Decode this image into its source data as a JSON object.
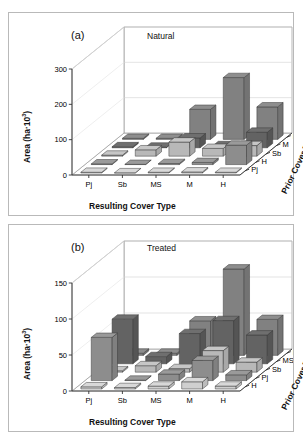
{
  "figure": {
    "background": "#ffffff",
    "border_color": "#b9b9b9"
  },
  "panels": [
    {
      "id": "a",
      "letter": "(a)",
      "subtitle": "Natural",
      "ylabel_prefix": "Area (ha·10",
      "ylabel_sup": "3",
      "ylabel_suffix": ")",
      "xlabel": "Resulting Cover Type",
      "zlabel": "Prior Cover Type",
      "yticks": [
        "0",
        "100",
        "200",
        "300"
      ],
      "xticks": [
        "Pj",
        "Sb",
        "MS",
        "M",
        "H"
      ],
      "zticks_front_to_back": [
        "Pj",
        "H",
        "Sb",
        "M",
        "MS"
      ]
    },
    {
      "id": "b",
      "letter": "(b)",
      "subtitle": "Treated",
      "ylabel_prefix": "Area (ha·10",
      "ylabel_sup": "3",
      "ylabel_suffix": ")",
      "xlabel": "Resulting Cover Type",
      "zlabel": "Prior Cover Type",
      "yticks": [
        "0",
        "50",
        "100",
        "150"
      ],
      "xticks": [
        "Pj",
        "Sb",
        "MS",
        "M",
        "H"
      ],
      "zticks_front_to_back": [
        "H",
        "Pj",
        "Sb",
        "MS",
        "M"
      ]
    }
  ],
  "row_colors": {
    "top": [
      "#d8d8d8",
      "#9a9a9a",
      "#c6c6c6",
      "#6f6f6f",
      "#8e8e8e"
    ],
    "side": [
      "#bcbcbc",
      "#808080",
      "#a8a8a8",
      "#555555",
      "#737373"
    ],
    "front": [
      "#cfcfcf",
      "#8d8d8d",
      "#b8b8b8",
      "#636363",
      "#818181"
    ]
  },
  "chart_data": [
    {
      "type": "bar",
      "title": "Natural",
      "subplot": "(a)",
      "xlabel": "Resulting Cover Type",
      "ylabel": "Area (ha·10^3)",
      "zlabel": "Prior Cover Type",
      "categories": [
        "Pj",
        "Sb",
        "MS",
        "M",
        "H"
      ],
      "ylim": [
        0,
        300
      ],
      "yticks": [
        0,
        100,
        200,
        300
      ],
      "grid": true,
      "legend": "none",
      "series": [
        {
          "name": "Pj",
          "row_index": 0,
          "values": [
            2,
            0,
            2,
            3,
            2
          ]
        },
        {
          "name": "H",
          "row_index": 1,
          "values": [
            2,
            0,
            3,
            6,
            55
          ]
        },
        {
          "name": "Sb",
          "row_index": 2,
          "values": [
            3,
            18,
            40,
            22,
            30
          ]
        },
        {
          "name": "M",
          "row_index": 3,
          "values": [
            3,
            2,
            28,
            6,
            44
          ]
        },
        {
          "name": "MS",
          "row_index": 4,
          "values": [
            3,
            3,
            85,
            175,
            92
          ]
        }
      ]
    },
    {
      "type": "bar",
      "title": "Treated",
      "subplot": "(b)",
      "xlabel": "Resulting Cover Type",
      "ylabel": "Area (ha·10^3)",
      "zlabel": "Prior Cover Type",
      "categories": [
        "Pj",
        "Sb",
        "MS",
        "M",
        "H"
      ],
      "ylim": [
        0,
        150
      ],
      "yticks": [
        0,
        50,
        100,
        150
      ],
      "grid": true,
      "legend": "none",
      "series": [
        {
          "name": "H",
          "row_index": 0,
          "values": [
            3,
            2,
            4,
            10,
            4
          ]
        },
        {
          "name": "Pj",
          "row_index": 1,
          "values": [
            60,
            0,
            9,
            28,
            8
          ]
        },
        {
          "name": "Sb",
          "row_index": 2,
          "values": [
            2,
            9,
            5,
            30,
            14
          ]
        },
        {
          "name": "MS",
          "row_index": 3,
          "values": [
            62,
            10,
            42,
            60,
            40
          ]
        },
        {
          "name": "M",
          "row_index": 4,
          "values": [
            3,
            3,
            48,
            120,
            50
          ]
        }
      ]
    }
  ]
}
